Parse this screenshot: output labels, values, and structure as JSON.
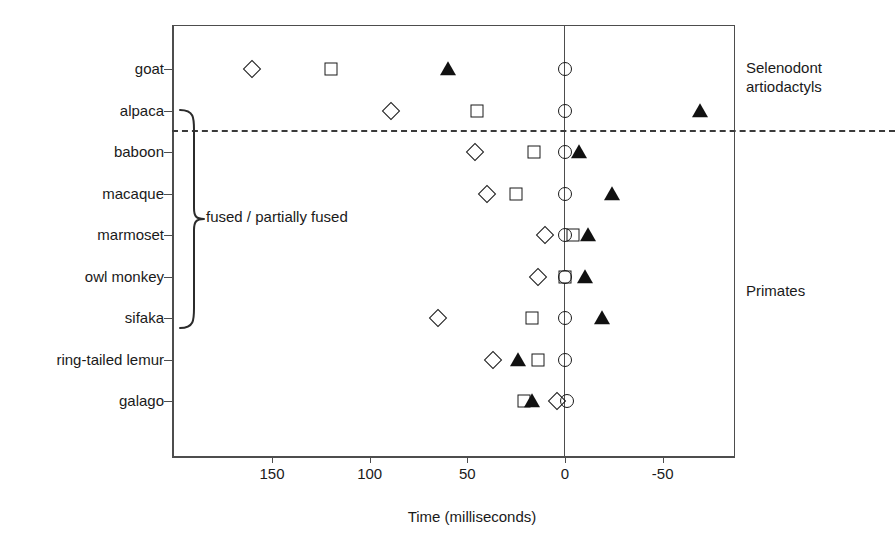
{
  "chart_data": {
    "type": "scatter",
    "title": "",
    "xlabel": "Time (milliseconds)",
    "ylabel": "",
    "xlim": [
      175,
      -75
    ],
    "x_reversed": true,
    "grid": false,
    "legend_position": "none",
    "xticks": [
      150,
      100,
      50,
      0,
      -50
    ],
    "xtick_labels": [
      "150",
      "100",
      "50",
      "0",
      "-50"
    ],
    "categories": [
      "goat",
      "alpaca",
      "baboon",
      "macaque",
      "marmoset",
      "owl monkey",
      "sifaka",
      "ring-tailed lemur",
      "galago"
    ],
    "series": [
      {
        "name": "open-diamond",
        "marker": "diamond-open",
        "values": [
          160,
          89,
          46,
          40,
          10,
          14,
          65,
          37,
          4
        ]
      },
      {
        "name": "open-square",
        "marker": "square-open",
        "values": [
          120,
          45,
          16,
          25,
          -4,
          0,
          17,
          14,
          21
        ]
      },
      {
        "name": "filled-triangle",
        "marker": "triangle-filled",
        "values": [
          60,
          -69,
          -7,
          -24,
          -12,
          -10,
          -19,
          24,
          17
        ]
      },
      {
        "name": "open-circle",
        "marker": "circle-open",
        "values": [
          0,
          0,
          0,
          0,
          0,
          0,
          0,
          0,
          -1
        ]
      }
    ],
    "annotations": [
      {
        "name": "group-divider",
        "type": "dashed-horizontal-line",
        "between": [
          "alpaca",
          "baboon"
        ]
      },
      {
        "name": "fused-brace",
        "type": "curly-brace",
        "label": "fused / partially fused",
        "spans": [
          "alpaca",
          "sifaka"
        ]
      },
      {
        "name": "selenodont-group",
        "type": "text",
        "label": "Selenodont\nartiodactyls"
      },
      {
        "name": "primates-group",
        "type": "text",
        "label": "Primates"
      }
    ]
  },
  "axis": {
    "x_title": "Time (milliseconds)"
  },
  "groups": {
    "selenodont": "Selenodont\nartiodactyls",
    "primates": "Primates"
  },
  "brace": {
    "label": "fused / partially fused"
  }
}
